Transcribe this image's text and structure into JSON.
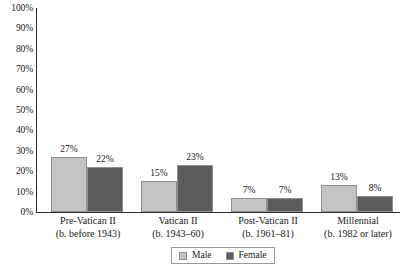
{
  "chart_data": {
    "type": "bar",
    "title": "",
    "subtitle": "",
    "xlabel": "",
    "ylabel": "",
    "ylim": [
      0,
      100
    ],
    "yunit": "%",
    "grid": false,
    "legend_position": "bottom",
    "categories": [
      {
        "line1": "Pre-Vatican II",
        "line2": "(b. before 1943)"
      },
      {
        "line1": "Vatican II",
        "line2": "(b. 1943–60)"
      },
      {
        "line1": "Post-Vatican II",
        "line2": "(b. 1961–81)"
      },
      {
        "line1": "Millennial",
        "line2": "(b. 1982 or later)"
      }
    ],
    "series": [
      {
        "name": "Male",
        "color": "#c4c4c4",
        "values": [
          27,
          15,
          7,
          13
        ],
        "labels": [
          "27%",
          "15%",
          "7%",
          "13%"
        ]
      },
      {
        "name": "Female",
        "color": "#5c5c5c",
        "values": [
          22,
          23,
          7,
          8
        ],
        "labels": [
          "22%",
          "23%",
          "7%",
          "8%"
        ]
      }
    ],
    "yticks": [
      {
        "value": 100,
        "label": "100%"
      },
      {
        "value": 90,
        "label": "90%"
      },
      {
        "value": 80,
        "label": "80%"
      },
      {
        "value": 70,
        "label": "70%"
      },
      {
        "value": 60,
        "label": "60%"
      },
      {
        "value": 50,
        "label": "50%"
      },
      {
        "value": 40,
        "label": "40%"
      },
      {
        "value": 30,
        "label": "30%"
      },
      {
        "value": 20,
        "label": "20%"
      },
      {
        "value": 10,
        "label": "10%"
      },
      {
        "value": 0,
        "label": "0%"
      }
    ]
  },
  "legend": {
    "items": [
      {
        "label": "Male",
        "color": "#c4c4c4"
      },
      {
        "label": "Female",
        "color": "#5c5c5c"
      }
    ]
  },
  "colors": {
    "male": "#c4c4c4",
    "female": "#5c5c5c",
    "axis": "#2b2b2b",
    "bar_border": "#8f8f8f",
    "text": "#1a1a1a",
    "background": "#ffffff"
  }
}
